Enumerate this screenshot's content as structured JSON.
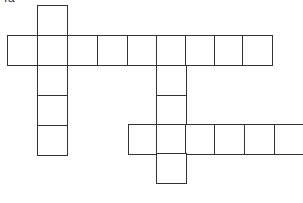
{
  "puzzle": {
    "caption": "Ta",
    "cell_size": 30,
    "line_color": "#333333",
    "cells": [
      {
        "x": 37,
        "y": 5
      },
      {
        "x": 7,
        "y": 35
      },
      {
        "x": 37,
        "y": 35
      },
      {
        "x": 67,
        "y": 35
      },
      {
        "x": 97,
        "y": 35
      },
      {
        "x": 127,
        "y": 35
      },
      {
        "x": 156,
        "y": 35
      },
      {
        "x": 185,
        "y": 35
      },
      {
        "x": 214,
        "y": 35
      },
      {
        "x": 242,
        "y": 35
      },
      {
        "x": 37,
        "y": 65
      },
      {
        "x": 37,
        "y": 95
      },
      {
        "x": 37,
        "y": 125
      },
      {
        "x": 156,
        "y": 65
      },
      {
        "x": 156,
        "y": 95
      },
      {
        "x": 128,
        "y": 124
      },
      {
        "x": 156,
        "y": 124
      },
      {
        "x": 185,
        "y": 124
      },
      {
        "x": 214,
        "y": 124
      },
      {
        "x": 244,
        "y": 124
      },
      {
        "x": 274,
        "y": 124
      },
      {
        "x": 156,
        "y": 153
      }
    ]
  }
}
